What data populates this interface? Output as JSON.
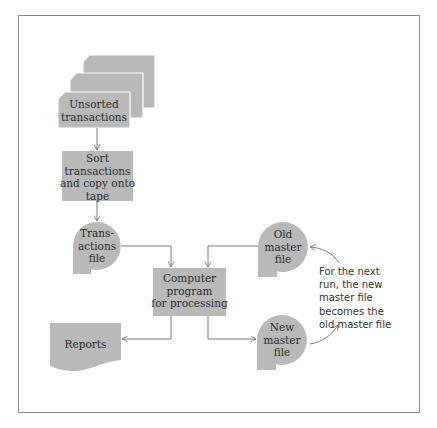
{
  "diagram": {
    "type": "flowchart",
    "title": "",
    "colors": {
      "shape_fill": "#b9b9b9",
      "line": "#6a6a6a",
      "text": "#2a2a2a"
    },
    "nodes": {
      "unsorted": {
        "shape": "punched-card-stack",
        "label_line1": "Unsorted",
        "label_line2": "transactions"
      },
      "sort": {
        "shape": "process-box",
        "label_line1": "Sort",
        "label_line2": "transactions",
        "label_line3": "and copy onto",
        "label_line4": "tape"
      },
      "trans_file": {
        "shape": "magnetic-tape",
        "label_line1": "Trans-",
        "label_line2": "actions",
        "label_line3": "file"
      },
      "old_master": {
        "shape": "magnetic-tape",
        "label_line1": "Old",
        "label_line2": "master",
        "label_line3": "file"
      },
      "computer": {
        "shape": "process-box",
        "label_line1": "Computer",
        "label_line2": "program",
        "label_line3": "for processing"
      },
      "reports": {
        "shape": "document",
        "label": "Reports"
      },
      "new_master": {
        "shape": "magnetic-tape",
        "label_line1": "New",
        "label_line2": "master",
        "label_line3": "file"
      }
    },
    "edges": [
      {
        "from": "unsorted",
        "to": "sort"
      },
      {
        "from": "sort",
        "to": "trans_file"
      },
      {
        "from": "trans_file",
        "to": "computer"
      },
      {
        "from": "old_master",
        "to": "computer"
      },
      {
        "from": "computer",
        "to": "reports"
      },
      {
        "from": "computer",
        "to": "new_master"
      },
      {
        "from": "new_master",
        "to": "old_master",
        "style": "curved-annotation"
      }
    ],
    "annotation": {
      "line1": "For the next",
      "line2": "run, the new",
      "line3": "master file",
      "line4": "becomes the",
      "line5": "old master file"
    }
  }
}
